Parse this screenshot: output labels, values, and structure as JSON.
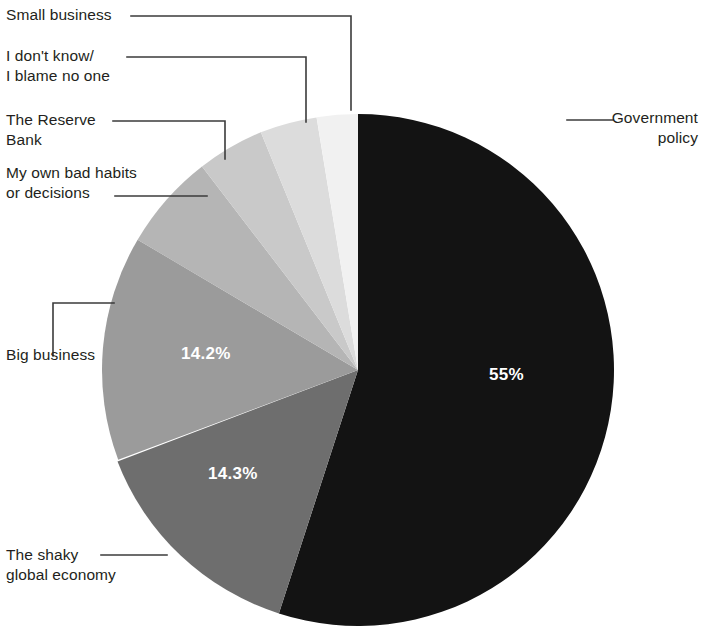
{
  "chart_data": {
    "type": "pie",
    "title": "",
    "subtitle": "",
    "xlabel": "",
    "ylabel": "",
    "legend_position": "callout-labels",
    "grid": false,
    "start_angle_deg": 0,
    "direction": "clockwise",
    "center": {
      "x": 358,
      "y": 370
    },
    "radius": 256,
    "categories": [
      "Government policy",
      "The shaky global economy",
      "Big business",
      "My own bad habits or decisions",
      "The Reserve Bank",
      "I don't know/ I blame no one",
      "Small business"
    ],
    "values": [
      55,
      14.3,
      14.2,
      6.1,
      4.2,
      3.6,
      2.6
    ],
    "labels": [
      "55%",
      "14.3%",
      "14.2%",
      "",
      "",
      "",
      ""
    ],
    "colors": [
      "#131313",
      "#6e6e6e",
      "#9b9b9b",
      "#b5b5b5",
      "#c9c9c9",
      "#dcdcdc",
      "#f1f1f1"
    ],
    "slices": [
      {
        "name": "Government policy",
        "value": 55,
        "label": "55%",
        "color": "#131313",
        "start_deg": 0,
        "end_deg": 198,
        "value_label_color": "#ffffff",
        "callout": "Government\npolicy"
      },
      {
        "name": "The shaky global economy",
        "value": 14.3,
        "label": "14.3%",
        "color": "#6e6e6e",
        "start_deg": 198,
        "end_deg": 249.5,
        "value_label_color": "#ffffff",
        "callout": "The shaky\nglobal economy"
      },
      {
        "name": "Big business",
        "value": 14.2,
        "label": "14.2%",
        "color": "#9b9b9b",
        "start_deg": 249.5,
        "end_deg": 300.6,
        "value_label_color": "#ffffff",
        "callout": "Big business"
      },
      {
        "name": "My own bad habits or decisions",
        "value": 6.1,
        "label": "",
        "color": "#b5b5b5",
        "start_deg": 300.6,
        "end_deg": 322.6,
        "value_label_color": "#ffffff",
        "callout": "My own bad habits\nor decisions"
      },
      {
        "name": "The Reserve Bank",
        "value": 4.2,
        "label": "",
        "color": "#c9c9c9",
        "start_deg": 322.6,
        "end_deg": 337.7,
        "value_label_color": "#ffffff",
        "callout": "The Reserve\nBank"
      },
      {
        "name": "I don't know/ I blame no one",
        "value": 3.6,
        "label": "",
        "color": "#dcdcdc",
        "start_deg": 337.7,
        "end_deg": 350.7,
        "value_label_color": "#ffffff",
        "callout": "I don't know/\nI blame no one"
      },
      {
        "name": "Small business",
        "value": 2.6,
        "label": "",
        "color": "#f1f1f1",
        "start_deg": 350.7,
        "end_deg": 360,
        "value_label_color": "#ffffff",
        "callout": "Small business"
      }
    ]
  },
  "callouts": {
    "small_business": "Small business",
    "i_dont_know": "I don't know/\nI blame no one",
    "reserve_bank": "The Reserve\nBank",
    "bad_habits": "My own bad habits\nor decisions",
    "big_business": "Big business",
    "shaky_economy": "The shaky\nglobal economy",
    "government_policy": "Government\npolicy"
  },
  "slice_labels": {
    "government_policy": "55%",
    "shaky_economy": "14.3%",
    "big_business": "14.2%"
  },
  "style": {
    "leader_line_color": "#3b3b3b",
    "background": "#ffffff",
    "text_color": "#231f20"
  }
}
